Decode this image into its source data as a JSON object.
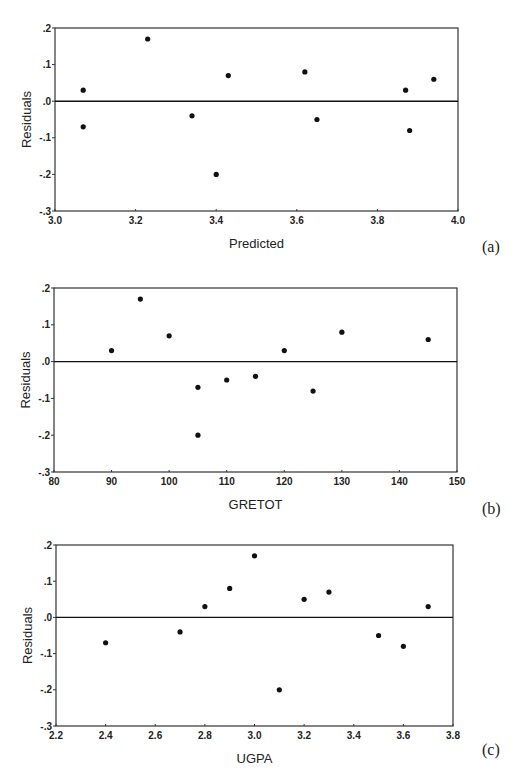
{
  "figure": {
    "panels": [
      {
        "id": "a",
        "label": "(a)",
        "xlabel": "Predicted",
        "ylabel": "Residuals"
      },
      {
        "id": "b",
        "label": "(b)",
        "xlabel": "GRETOT",
        "ylabel": "Residuals"
      },
      {
        "id": "c",
        "label": "(c)",
        "xlabel": "UGPA",
        "ylabel": "Residuals"
      }
    ]
  },
  "colors": {
    "points": "#111111",
    "axis": "#333333",
    "background": "#ffffff"
  },
  "chart_data": [
    {
      "type": "scatter",
      "panel": "(a)",
      "title": "",
      "xlabel": "Predicted",
      "ylabel": "Residuals",
      "xlim": [
        3.0,
        4.0
      ],
      "ylim": [
        -0.3,
        0.2
      ],
      "xticks": [
        "3.0",
        "3.2",
        "3.4",
        "3.6",
        "3.8",
        "4.0"
      ],
      "xtick_values": [
        3.0,
        3.2,
        3.4,
        3.6,
        3.8,
        4.0
      ],
      "yticks": [
        ".2",
        ".1",
        ".0",
        "-.1",
        "-.2",
        "-.3"
      ],
      "ytick_values": [
        0.2,
        0.1,
        0.0,
        -0.1,
        -0.2,
        -0.3
      ],
      "reference_line": 0.0,
      "grid": false,
      "x": [
        3.07,
        3.07,
        3.23,
        3.34,
        3.4,
        3.43,
        3.62,
        3.65,
        3.87,
        3.88,
        3.94
      ],
      "y": [
        0.03,
        -0.07,
        0.17,
        -0.04,
        -0.2,
        0.07,
        0.08,
        -0.05,
        0.03,
        -0.08,
        0.06
      ]
    },
    {
      "type": "scatter",
      "panel": "(b)",
      "title": "",
      "xlabel": "GRETOT",
      "ylabel": "Residuals",
      "xlim": [
        80,
        150
      ],
      "ylim": [
        -0.3,
        0.2
      ],
      "xticks": [
        "80",
        "90",
        "100",
        "110",
        "120",
        "130",
        "140",
        "150"
      ],
      "xtick_values": [
        80,
        90,
        100,
        110,
        120,
        130,
        140,
        150
      ],
      "yticks": [
        ".2",
        ".1",
        ".0",
        "-.1",
        "-.2",
        "-.3"
      ],
      "ytick_values": [
        0.2,
        0.1,
        0.0,
        -0.1,
        -0.2,
        -0.3
      ],
      "reference_line": 0.0,
      "grid": false,
      "x": [
        90,
        95,
        100,
        105,
        105,
        110,
        115,
        120,
        125,
        130,
        145
      ],
      "y": [
        0.03,
        0.17,
        0.07,
        -0.07,
        -0.2,
        -0.05,
        -0.04,
        0.03,
        -0.08,
        0.08,
        0.06
      ]
    },
    {
      "type": "scatter",
      "panel": "(c)",
      "title": "",
      "xlabel": "UGPA",
      "ylabel": "Residuals",
      "xlim": [
        2.2,
        3.8
      ],
      "ylim": [
        -0.3,
        0.2
      ],
      "xticks": [
        "2.2",
        "2.4",
        "2.6",
        "2.8",
        "3.0",
        "3.2",
        "3.4",
        "3.6",
        "3.8"
      ],
      "xtick_values": [
        2.2,
        2.4,
        2.6,
        2.8,
        3.0,
        3.2,
        3.4,
        3.6,
        3.8
      ],
      "yticks": [
        ".2",
        ".1",
        ".0",
        "-.1",
        "-.2",
        "-.3"
      ],
      "ytick_values": [
        0.2,
        0.1,
        0.0,
        -0.1,
        -0.2,
        -0.3
      ],
      "reference_line": 0.0,
      "grid": false,
      "x": [
        2.4,
        2.7,
        2.8,
        2.9,
        3.0,
        3.1,
        3.2,
        3.3,
        3.5,
        3.6,
        3.7
      ],
      "y": [
        -0.07,
        -0.04,
        0.03,
        0.08,
        0.17,
        -0.2,
        0.05,
        0.07,
        -0.05,
        -0.08,
        0.03
      ]
    }
  ]
}
